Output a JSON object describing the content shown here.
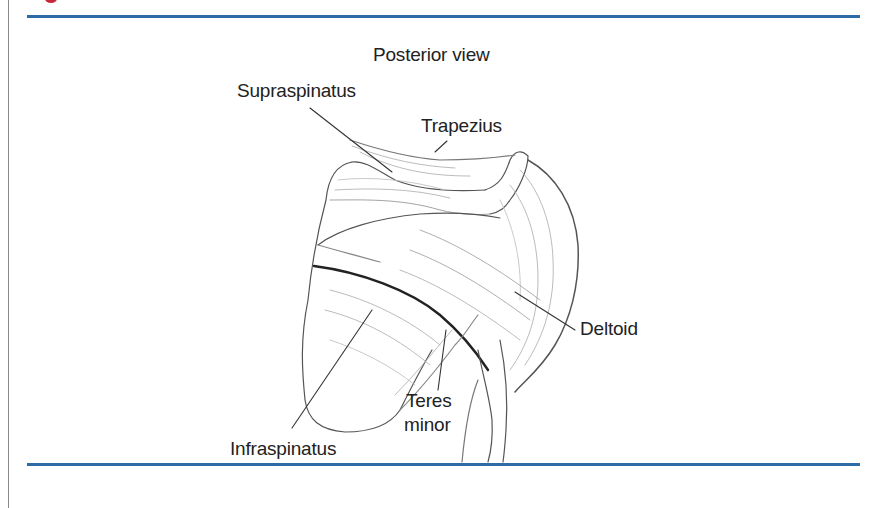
{
  "figure": {
    "title": "Posterior view",
    "labels": {
      "supraspinatus": "Supraspinatus",
      "trapezius": "Trapezius",
      "deltoid": "Deltoid",
      "teres_minor_line1": "Teres",
      "teres_minor_line2": "minor",
      "infraspinatus": "Infraspinatus"
    }
  },
  "colors": {
    "rule": "#2e6aa6",
    "accent": "#c8283a",
    "ink": "#222222"
  }
}
